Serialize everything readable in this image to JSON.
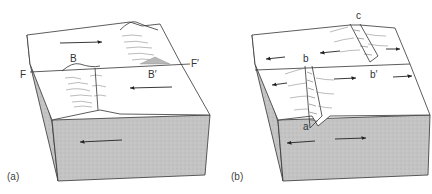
{
  "figure": {
    "panels": [
      {
        "id": "a",
        "label": "(a)",
        "features": {
          "ridge_label_left": "B",
          "ridge_label_right": "B′",
          "fault_label_left": "F",
          "fault_label_right": "F′"
        },
        "description": "Transform fault offsetting a ridge/mountain belt; opposite horizontal motion across fault F–F′"
      },
      {
        "id": "b",
        "label": "(b)",
        "features": {
          "rift_label_end": "a",
          "rift_label_mid": "b",
          "rift_label_offset": "b′",
          "rift_label_far": "c"
        },
        "description": "Rift segments a–b and b′–c offset by transform fault; divergent motion arrows"
      }
    ]
  },
  "colors": {
    "line": "#333333",
    "side_fill": "#bdbdbd",
    "top_fill": "#ffffff"
  }
}
